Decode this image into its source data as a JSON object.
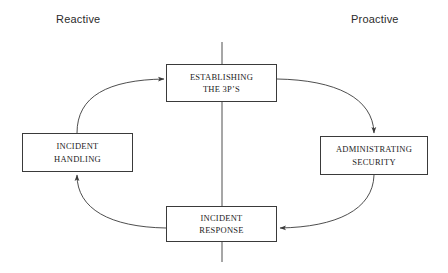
{
  "diagram": {
    "title_left": "Reactive",
    "title_right": "Proactive",
    "stroke_color": "#3a3a3a",
    "text_color": "#1d1d1d",
    "background_color": "#ffffff",
    "nodes": [
      {
        "id": "establishing",
        "line1": "ESTABLISHING",
        "line2": "THE 3P’S"
      },
      {
        "id": "incident-handling",
        "line1": "INCIDENT",
        "line2": "HANDLING"
      },
      {
        "id": "administrating",
        "line1": "ADMINISTRATING",
        "line2": "SECURITY"
      },
      {
        "id": "incident-response",
        "line1": "INCIDENT",
        "line2": "RESPONSE"
      }
    ],
    "edges": [
      {
        "from": "incident-handling",
        "to": "establishing",
        "style": "curved",
        "arrow": "to-left-edge"
      },
      {
        "from": "establishing",
        "to": "administrating",
        "style": "curved",
        "arrow": "to-top-edge"
      },
      {
        "from": "administrating",
        "to": "incident-response",
        "style": "curved",
        "arrow": "to-right-edge"
      },
      {
        "from": "incident-response",
        "to": "incident-handling",
        "style": "curved",
        "arrow": "to-bottom-edge"
      }
    ],
    "divider": {
      "orientation": "vertical",
      "label": "reactive-proactive-divider"
    }
  }
}
